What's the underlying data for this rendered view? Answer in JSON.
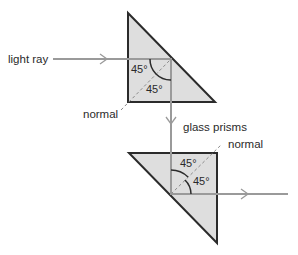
{
  "diagram": {
    "labels": {
      "light_ray": "light ray",
      "normal_top": "normal",
      "glass_prisms": "glass prisms",
      "normal_bottom": "normal"
    },
    "angles": {
      "top_incident": "45°",
      "top_reflected": "45°",
      "bottom_incident": "45°",
      "bottom_reflected": "45°"
    },
    "colors": {
      "prism_fill": "#dedede",
      "prism_edge": "#2b2b2b",
      "ray": "#9a9a9a",
      "normal_line": "#8a8a8a",
      "text": "#2a2a2a"
    }
  }
}
